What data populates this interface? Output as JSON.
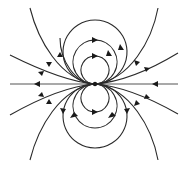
{
  "diagram": {
    "title": "",
    "colors": {
      "line": "#2a2a2a",
      "arrow": "#1a1a1a",
      "axis": "#555555",
      "background": "#ffffff"
    },
    "loops_per_side": 3,
    "open_lines_per_side_per_half": 3,
    "axis_line": true,
    "flow_direction": "left-outward from center on left, inward from right; loops run left-to-right"
  }
}
